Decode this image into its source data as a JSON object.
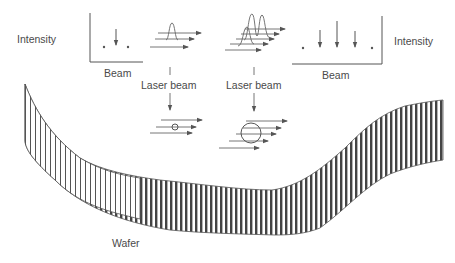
{
  "figure": {
    "colors": {
      "ink": "#555555",
      "text": "#4a4a4a",
      "wafer_stripe": "#444444",
      "background": "#ffffff"
    },
    "labels": {
      "intensity_left": "Intensity",
      "intensity_right": "Intensity",
      "beam_left": "Beam",
      "beam_right": "Beam",
      "laser_beam_left": "Laser beam",
      "laser_beam_right": "Laser beam",
      "wafer": "Wafer"
    },
    "left_graph": {
      "axis": "Intensity vs Beam",
      "points": [
        {
          "beam": 1,
          "intensity": 0
        },
        {
          "beam": 2,
          "intensity": 1
        },
        {
          "beam": 3,
          "intensity": 0
        }
      ]
    },
    "right_graph": {
      "axis": "Intensity vs Beam",
      "points": [
        {
          "beam": 1,
          "intensity": 0
        },
        {
          "beam": 2,
          "intensity": 1
        },
        {
          "beam": 3,
          "intensity": 1.6
        },
        {
          "beam": 4,
          "intensity": 1
        },
        {
          "beam": 5,
          "intensity": 0
        }
      ]
    },
    "small_particle": {
      "beam_lines": 3,
      "label": "small particle"
    },
    "large_particle": {
      "beam_lines": 5,
      "label": "large particle"
    }
  }
}
